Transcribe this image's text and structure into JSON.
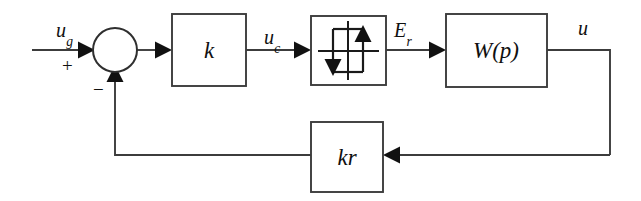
{
  "diagram": {
    "background_color": "#ffffff",
    "line_color": "#3c3c3c",
    "text_color": "#101010",
    "blocks": [
      {
        "id": "gain-k",
        "label_main": "k",
        "label_sub": "",
        "x": 172,
        "y": 14,
        "w": 74,
        "h": 72
      },
      {
        "id": "relay",
        "label_main": "",
        "label_sub": "",
        "x": 311,
        "y": 16,
        "w": 75,
        "h": 69
      },
      {
        "id": "plant-w",
        "label_main": "W",
        "label_sub": "(p)",
        "x": 446,
        "y": 14,
        "w": 101,
        "h": 73
      },
      {
        "id": "feedback-kr",
        "label_main": "k",
        "label_sub": "r",
        "x": 311,
        "y": 122,
        "w": 72,
        "h": 70
      }
    ],
    "summing_junction": {
      "cx": 115,
      "cy": 50,
      "r": 22
    },
    "signals": [
      {
        "id": "input",
        "label_main": "u",
        "label_sub": "g",
        "x": 56,
        "y": 20
      },
      {
        "id": "control",
        "label_main": "u",
        "label_sub": "c",
        "x": 264,
        "y": 27
      },
      {
        "id": "relay-output",
        "label_main": "E",
        "label_sub": "r",
        "x": 394,
        "y": 20
      },
      {
        "id": "plant-output",
        "label_main": "u",
        "label_sub": "",
        "x": 578,
        "y": 18
      }
    ],
    "signs": [
      {
        "id": "plus-sign",
        "text": "+",
        "x": 62,
        "y": 56
      },
      {
        "id": "minus-sign",
        "text": "−",
        "x": 93,
        "y": 80
      }
    ]
  }
}
